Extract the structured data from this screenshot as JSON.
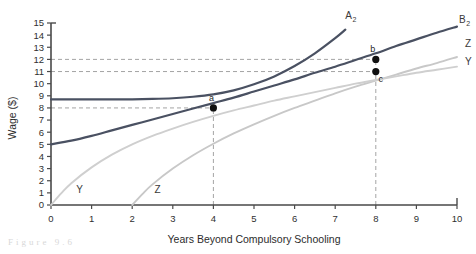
{
  "chart_data": {
    "type": "line",
    "title": "",
    "xlabel": "Years Beyond Compulsory Schooling",
    "ylabel": "Wage ($)",
    "xlim": [
      0,
      10
    ],
    "ylim": [
      0,
      15
    ],
    "xticks": [
      "0",
      "1",
      "2",
      "3",
      "4",
      "5",
      "6",
      "7",
      "8",
      "9",
      "10"
    ],
    "yticks": [
      "0",
      "1",
      "2",
      "3",
      "4",
      "5",
      "6",
      "7",
      "8",
      "9",
      "10",
      "11",
      "12",
      "13",
      "14",
      "15"
    ],
    "grid": false,
    "legend_position": "inline-curve-labels",
    "series": [
      {
        "name": "A2",
        "label": "A",
        "subscript": "2",
        "color": "#4a5162",
        "style": "solid",
        "weight": "thick",
        "label_position": {
          "x": 7.25,
          "y": 15.3
        },
        "points": [
          {
            "x": 0.0,
            "y": 8.7
          },
          {
            "x": 0.5,
            "y": 8.7
          },
          {
            "x": 1.0,
            "y": 8.7
          },
          {
            "x": 1.5,
            "y": 8.7
          },
          {
            "x": 2.0,
            "y": 8.71
          },
          {
            "x": 2.5,
            "y": 8.74
          },
          {
            "x": 3.0,
            "y": 8.8
          },
          {
            "x": 3.5,
            "y": 8.92
          },
          {
            "x": 4.0,
            "y": 9.12
          },
          {
            "x": 4.5,
            "y": 9.45
          },
          {
            "x": 5.0,
            "y": 9.95
          },
          {
            "x": 5.5,
            "y": 10.6
          },
          {
            "x": 6.0,
            "y": 11.45
          },
          {
            "x": 6.5,
            "y": 12.5
          },
          {
            "x": 7.0,
            "y": 13.75
          },
          {
            "x": 7.25,
            "y": 14.45
          }
        ]
      },
      {
        "name": "B2",
        "label": "B",
        "subscript": "2",
        "color": "#4a5162",
        "style": "solid",
        "weight": "thick",
        "label_position": {
          "x": 10.05,
          "y": 15.0
        },
        "points": [
          {
            "x": 0.0,
            "y": 5.0
          },
          {
            "x": 0.5,
            "y": 5.3
          },
          {
            "x": 1.0,
            "y": 5.7
          },
          {
            "x": 1.5,
            "y": 6.15
          },
          {
            "x": 2.0,
            "y": 6.6
          },
          {
            "x": 2.5,
            "y": 7.05
          },
          {
            "x": 3.0,
            "y": 7.5
          },
          {
            "x": 3.5,
            "y": 7.95
          },
          {
            "x": 4.0,
            "y": 8.4
          },
          {
            "x": 4.5,
            "y": 8.85
          },
          {
            "x": 5.0,
            "y": 9.35
          },
          {
            "x": 5.5,
            "y": 9.85
          },
          {
            "x": 6.0,
            "y": 10.35
          },
          {
            "x": 6.5,
            "y": 10.9
          },
          {
            "x": 7.0,
            "y": 11.4
          },
          {
            "x": 7.5,
            "y": 11.95
          },
          {
            "x": 8.0,
            "y": 12.5
          },
          {
            "x": 8.5,
            "y": 13.1
          },
          {
            "x": 9.0,
            "y": 13.65
          },
          {
            "x": 9.5,
            "y": 14.2
          },
          {
            "x": 10.0,
            "y": 14.7
          }
        ]
      },
      {
        "name": "Z",
        "label": "Z",
        "color": "#c8c8c8",
        "style": "solid",
        "weight": "medium",
        "label_position_start": {
          "x": 2.55,
          "y": 0.95
        },
        "label_position_end": {
          "x": 10.2,
          "y": 13.0
        },
        "points": [
          {
            "x": 2.0,
            "y": 0.0
          },
          {
            "x": 2.25,
            "y": 0.9
          },
          {
            "x": 2.5,
            "y": 1.7
          },
          {
            "x": 3.0,
            "y": 3.0
          },
          {
            "x": 3.5,
            "y": 4.1
          },
          {
            "x": 4.0,
            "y": 5.05
          },
          {
            "x": 4.5,
            "y": 5.9
          },
          {
            "x": 5.0,
            "y": 6.65
          },
          {
            "x": 5.5,
            "y": 7.35
          },
          {
            "x": 6.0,
            "y": 8.0
          },
          {
            "x": 6.5,
            "y": 8.6
          },
          {
            "x": 7.0,
            "y": 9.2
          },
          {
            "x": 7.5,
            "y": 9.75
          },
          {
            "x": 8.0,
            "y": 10.25
          },
          {
            "x": 8.5,
            "y": 10.75
          },
          {
            "x": 9.0,
            "y": 11.25
          },
          {
            "x": 9.5,
            "y": 11.7
          },
          {
            "x": 10.0,
            "y": 12.2
          }
        ]
      },
      {
        "name": "Y",
        "label": "Y",
        "color": "#cfcfcf",
        "style": "solid",
        "weight": "medium",
        "label_position_start": {
          "x": 0.62,
          "y": 0.95
        },
        "label_position_end": {
          "x": 10.2,
          "y": 11.55
        },
        "points": [
          {
            "x": 0.0,
            "y": 0.0
          },
          {
            "x": 0.25,
            "y": 0.95
          },
          {
            "x": 0.5,
            "y": 1.8
          },
          {
            "x": 1.0,
            "y": 3.1
          },
          {
            "x": 1.5,
            "y": 4.15
          },
          {
            "x": 2.0,
            "y": 5.0
          },
          {
            "x": 2.5,
            "y": 5.7
          },
          {
            "x": 3.0,
            "y": 6.3
          },
          {
            "x": 3.5,
            "y": 6.85
          },
          {
            "x": 4.0,
            "y": 7.35
          },
          {
            "x": 4.5,
            "y": 7.8
          },
          {
            "x": 5.0,
            "y": 8.2
          },
          {
            "x": 5.5,
            "y": 8.6
          },
          {
            "x": 6.0,
            "y": 8.95
          },
          {
            "x": 6.5,
            "y": 9.3
          },
          {
            "x": 7.0,
            "y": 9.65
          },
          {
            "x": 7.5,
            "y": 10.0
          },
          {
            "x": 8.0,
            "y": 10.3
          },
          {
            "x": 8.5,
            "y": 10.6
          },
          {
            "x": 9.0,
            "y": 10.9
          },
          {
            "x": 9.5,
            "y": 11.15
          },
          {
            "x": 10.0,
            "y": 11.4
          }
        ]
      }
    ],
    "annotations": [
      {
        "name": "point-a",
        "label": "a",
        "x": 4,
        "y": 8,
        "label_dx": -2,
        "label_dy": -7
      },
      {
        "name": "point-b",
        "label": "b",
        "x": 8,
        "y": 12,
        "label_dx": -3,
        "label_dy": -7
      },
      {
        "name": "point-c",
        "label": "c",
        "x": 8,
        "y": 11,
        "label_dx": 5,
        "label_dy": 10
      }
    ],
    "reference_lines": [
      {
        "name": "hline-8",
        "orientation": "horizontal",
        "value": 8,
        "from": 0,
        "to": 4,
        "style": "dashed"
      },
      {
        "name": "hline-11",
        "orientation": "horizontal",
        "value": 11,
        "from": 0,
        "to": 8,
        "style": "dashed"
      },
      {
        "name": "hline-12",
        "orientation": "horizontal",
        "value": 12,
        "from": 0,
        "to": 8,
        "style": "dashed"
      },
      {
        "name": "vline-4",
        "orientation": "vertical",
        "value": 4,
        "from": 0,
        "to": 8,
        "style": "dashed"
      },
      {
        "name": "vline-8",
        "orientation": "vertical",
        "value": 8,
        "from": 0,
        "to": 12,
        "style": "dashed"
      }
    ]
  },
  "figure": {
    "caption": "Figure  9.6"
  },
  "colors": {
    "axis": "#4a4a4a",
    "dark_curve": "#4a5162",
    "light_curve": "#cacaca",
    "dash": "#9a9a9a",
    "point": "#111111"
  }
}
